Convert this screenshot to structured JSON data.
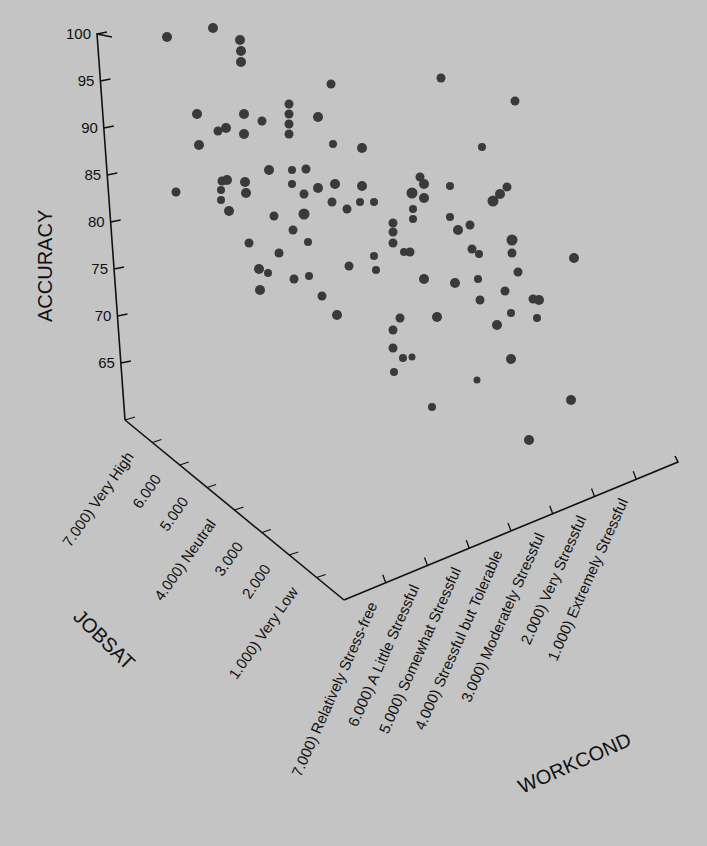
{
  "chart_data": {
    "type": "scatter",
    "subtype": "3d-scatter",
    "title": "",
    "axes": {
      "z": {
        "label": "ACCURACY",
        "ticks": [
          100,
          95,
          90,
          85,
          80,
          75,
          70,
          65
        ],
        "range": [
          60,
          100
        ]
      },
      "y": {
        "label": "JOBSAT",
        "ticks": [
          "7.000) Very High",
          "6.000",
          "5.000",
          "4.000) Neutral",
          "3.000",
          "2.000",
          "1.000) Very Low"
        ]
      },
      "x": {
        "label": "WORKCOND",
        "ticks": [
          "7.000) Relatively Stress-free",
          "6.000) A Little Stressful",
          "5.000) Somewhat Stressful",
          "4.000) Stressful but Tolerable",
          "3.000) Moderately Stressful",
          "2.000) Very Stressful",
          "1.000) Extremely Stressful"
        ]
      }
    },
    "grid": false,
    "legend": null,
    "point_color": "#3a3a3a",
    "background": "#c4c4c4",
    "points_px": [
      [
        167,
        37,
        5
      ],
      [
        213,
        28,
        5
      ],
      [
        240,
        40,
        5
      ],
      [
        241,
        51,
        5
      ],
      [
        241,
        62,
        5
      ],
      [
        176,
        192,
        4.5
      ],
      [
        197,
        114,
        5
      ],
      [
        199,
        145,
        5
      ],
      [
        218,
        131,
        4.5
      ],
      [
        226,
        128,
        5
      ],
      [
        244,
        114,
        5
      ],
      [
        244,
        134,
        5
      ],
      [
        262,
        121,
        4.5
      ],
      [
        289,
        104,
        4.5
      ],
      [
        289,
        114,
        4.5
      ],
      [
        289,
        124,
        4.5
      ],
      [
        289,
        134,
        4.5
      ],
      [
        318,
        117,
        5
      ],
      [
        331,
        84,
        4.5
      ],
      [
        333,
        144,
        4
      ],
      [
        362,
        148,
        5
      ],
      [
        441,
        78,
        4.5
      ],
      [
        515,
        101,
        4.5
      ],
      [
        482,
        147,
        4
      ],
      [
        222,
        181,
        4.5
      ],
      [
        221,
        190,
        4
      ],
      [
        221,
        200,
        4
      ],
      [
        227,
        180,
        5
      ],
      [
        229,
        211,
        5
      ],
      [
        245,
        182,
        5
      ],
      [
        246,
        193,
        5
      ],
      [
        269,
        170,
        5
      ],
      [
        274,
        216,
        4.5
      ],
      [
        292,
        184,
        4
      ],
      [
        292,
        170,
        4
      ],
      [
        306,
        169,
        4.5
      ],
      [
        304,
        194,
        4.5
      ],
      [
        318,
        188,
        5
      ],
      [
        332,
        202,
        4.5
      ],
      [
        335,
        184,
        5
      ],
      [
        347,
        209,
        4.5
      ],
      [
        362,
        186,
        5
      ],
      [
        374,
        202,
        4
      ],
      [
        279,
        253,
        4.5
      ],
      [
        249,
        243,
        4.5
      ],
      [
        259,
        269,
        5
      ],
      [
        260,
        290,
        5
      ],
      [
        268,
        273,
        4
      ],
      [
        293,
        230,
        4.5
      ],
      [
        304,
        214,
        5.5
      ],
      [
        308,
        242,
        4
      ],
      [
        309,
        276,
        4
      ],
      [
        294,
        279,
        4.5
      ],
      [
        322,
        296,
        4.5
      ],
      [
        349,
        266,
        4.5
      ],
      [
        337,
        315,
        5
      ],
      [
        360,
        202,
        4
      ],
      [
        374,
        256,
        4
      ],
      [
        376,
        270,
        4
      ],
      [
        393,
        223,
        4.5
      ],
      [
        393,
        232,
        4.5
      ],
      [
        393,
        243,
        4.5
      ],
      [
        404,
        252,
        4
      ],
      [
        420,
        177,
        4.5
      ],
      [
        412,
        193,
        5.5
      ],
      [
        424,
        184,
        5
      ],
      [
        424,
        198,
        5
      ],
      [
        413,
        209,
        4
      ],
      [
        413,
        219,
        4
      ],
      [
        450,
        186,
        4
      ],
      [
        450,
        217,
        4
      ],
      [
        458,
        230,
        5
      ],
      [
        470,
        225,
        4.5
      ],
      [
        493,
        201,
        5.5
      ],
      [
        500,
        194,
        5
      ],
      [
        507,
        187,
        4.5
      ],
      [
        512,
        240,
        5.5
      ],
      [
        512,
        253,
        4.5
      ],
      [
        472,
        249,
        4.5
      ],
      [
        424,
        279,
        5
      ],
      [
        479,
        254,
        4
      ],
      [
        455,
        283,
        5
      ],
      [
        480,
        300,
        4.5
      ],
      [
        437,
        317,
        5
      ],
      [
        518,
        272,
        4.5
      ],
      [
        410,
        252,
        4.5
      ],
      [
        393,
        330,
        4.5
      ],
      [
        393,
        348,
        4.5
      ],
      [
        403,
        358,
        4
      ],
      [
        394,
        372,
        4
      ],
      [
        412,
        357,
        3.5
      ],
      [
        432,
        407,
        4
      ],
      [
        477,
        380,
        3.5
      ],
      [
        497,
        325,
        5
      ],
      [
        533,
        299,
        4.5
      ],
      [
        511,
        313,
        4
      ],
      [
        478,
        279,
        4
      ],
      [
        574,
        258,
        5
      ],
      [
        505,
        291,
        4.5
      ],
      [
        539,
        300,
        5
      ],
      [
        571,
        400,
        5
      ],
      [
        529,
        440,
        5
      ],
      [
        511,
        359,
        5
      ],
      [
        537,
        318,
        4
      ],
      [
        400,
        318,
        4.5
      ]
    ]
  }
}
